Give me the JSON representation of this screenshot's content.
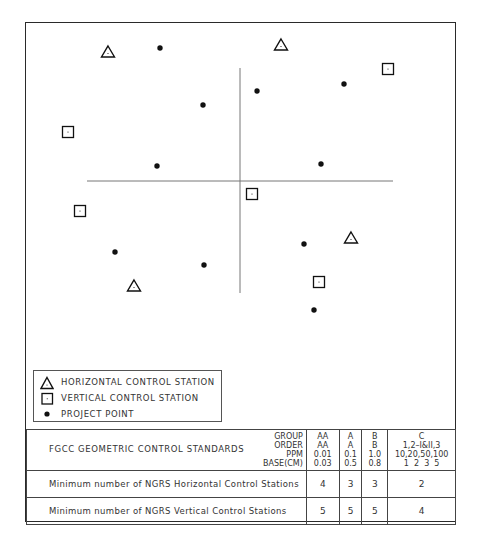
{
  "figure": {
    "type": "survey network control diagram",
    "axes": {
      "horizontal_line": {
        "x1": 87,
        "x2": 393,
        "y": 181
      },
      "vertical_line": {
        "x": 240,
        "y1": 68,
        "y2": 293
      }
    },
    "horizontal_control_stations": [
      {
        "x": 108,
        "y": 52
      },
      {
        "x": 281,
        "y": 45
      },
      {
        "x": 351,
        "y": 238
      },
      {
        "x": 134,
        "y": 286
      }
    ],
    "vertical_control_stations": [
      {
        "x": 388,
        "y": 69
      },
      {
        "x": 68,
        "y": 132
      },
      {
        "x": 252,
        "y": 194
      },
      {
        "x": 80,
        "y": 211
      },
      {
        "x": 319,
        "y": 282
      }
    ],
    "project_points": [
      {
        "x": 160,
        "y": 48
      },
      {
        "x": 344,
        "y": 84
      },
      {
        "x": 257,
        "y": 91
      },
      {
        "x": 203,
        "y": 105
      },
      {
        "x": 157,
        "y": 166
      },
      {
        "x": 321,
        "y": 164
      },
      {
        "x": 115,
        "y": 252
      },
      {
        "x": 304,
        "y": 244
      },
      {
        "x": 204,
        "y": 265
      },
      {
        "x": 314,
        "y": 310
      }
    ]
  },
  "legend": {
    "items": [
      {
        "icon": "triangle-icon",
        "label": "HORIZONTAL CONTROL STATION"
      },
      {
        "icon": "square-dot-icon",
        "label": "VERTICAL CONTROL STATION"
      },
      {
        "icon": "dot-icon",
        "label": "PROJECT POINT"
      }
    ]
  },
  "table": {
    "title": "FGCC GEOMETRIC CONTROL STANDARDS",
    "keys": [
      "GROUP",
      "ORDER",
      "PPM",
      "BASE(CM)"
    ],
    "columns": [
      {
        "group": "AA",
        "order": "AA",
        "ppm": "0.01",
        "base": "0.03"
      },
      {
        "group": "A",
        "order": "A",
        "ppm": "0.1",
        "base": "0.5"
      },
      {
        "group": "B",
        "order": "B",
        "ppm": "1.0",
        "base": "0.8"
      },
      {
        "group": "C",
        "order": "1,2–I&II,3",
        "ppm": "10,20,50,100",
        "base": "1  2  3  5"
      }
    ],
    "rows": [
      {
        "label": "Minimum number of NGRS Horizontal Control Stations",
        "values": [
          "4",
          "3",
          "3",
          "2"
        ]
      },
      {
        "label": "Minimum number of NGRS Vertical Control Stations",
        "values": [
          "5",
          "5",
          "5",
          "4"
        ]
      }
    ]
  },
  "colors": {
    "line": "#2a2a2a",
    "axis": "#777777",
    "symbol": "#111111"
  }
}
